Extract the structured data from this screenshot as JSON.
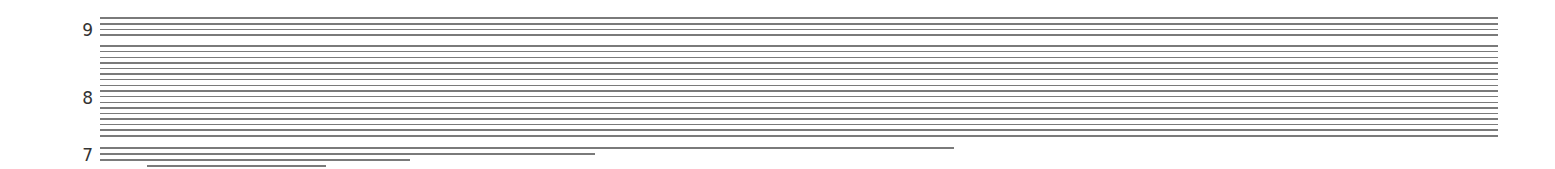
{
  "chart_data": {
    "type": "line",
    "title": "",
    "xlabel": "",
    "ylabel": "",
    "grid": false,
    "legend": null,
    "y_tick_labels": [
      {
        "label": "9",
        "y_px": 30
      },
      {
        "label": "8",
        "y_px": 98
      },
      {
        "label": "7",
        "y_px": 155
      }
    ],
    "segments": [
      {
        "y_px": 18,
        "x_start": 100,
        "x_end": 1498
      },
      {
        "y_px": 24,
        "x_start": 100,
        "x_end": 1498
      },
      {
        "y_px": 29.7,
        "x_start": 100,
        "x_end": 1498
      },
      {
        "y_px": 35,
        "x_start": 100,
        "x_end": 1498
      },
      {
        "y_px": 46,
        "x_start": 100,
        "x_end": 1498
      },
      {
        "y_px": 51.7,
        "x_start": 100,
        "x_end": 1498
      },
      {
        "y_px": 57.3,
        "x_start": 100,
        "x_end": 1498
      },
      {
        "y_px": 63,
        "x_start": 100,
        "x_end": 1498
      },
      {
        "y_px": 68.7,
        "x_start": 100,
        "x_end": 1498
      },
      {
        "y_px": 74,
        "x_start": 100,
        "x_end": 1498
      },
      {
        "y_px": 79.7,
        "x_start": 100,
        "x_end": 1498
      },
      {
        "y_px": 85.3,
        "x_start": 100,
        "x_end": 1498
      },
      {
        "y_px": 91,
        "x_start": 100,
        "x_end": 1498
      },
      {
        "y_px": 96.7,
        "x_start": 100,
        "x_end": 1498
      },
      {
        "y_px": 102.3,
        "x_start": 100,
        "x_end": 1498
      },
      {
        "y_px": 108,
        "x_start": 100,
        "x_end": 1498
      },
      {
        "y_px": 113.3,
        "x_start": 100,
        "x_end": 1498
      },
      {
        "y_px": 119,
        "x_start": 100,
        "x_end": 1498
      },
      {
        "y_px": 124.7,
        "x_start": 100,
        "x_end": 1498
      },
      {
        "y_px": 130,
        "x_start": 100,
        "x_end": 1498
      },
      {
        "y_px": 136,
        "x_start": 100,
        "x_end": 1498
      },
      {
        "y_px": 148,
        "x_start": 100,
        "x_end": 954
      },
      {
        "y_px": 154,
        "x_start": 100,
        "x_end": 595
      },
      {
        "y_px": 160,
        "x_start": 100,
        "x_end": 410
      },
      {
        "y_px": 166,
        "x_start": 147,
        "x_end": 326
      }
    ],
    "line_color": "#7a7a7a"
  }
}
